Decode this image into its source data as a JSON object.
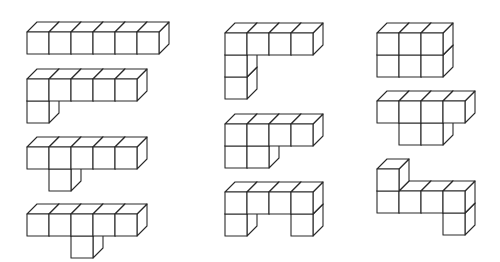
{
  "diagram": {
    "type": "polycube-figures",
    "background": "#ffffff",
    "stroke_color": "#2a2a2a",
    "cube_size": 22,
    "depth_dx": 10,
    "depth_dy": -10,
    "columns": 3,
    "figures": [
      {
        "name": "figure-1",
        "column": 1,
        "origin": [
          27,
          32
        ],
        "cubes": [
          [
            0,
            0
          ],
          [
            1,
            0
          ],
          [
            2,
            0
          ],
          [
            3,
            0
          ],
          [
            4,
            0
          ],
          [
            5,
            0
          ]
        ]
      },
      {
        "name": "figure-2",
        "column": 1,
        "origin": [
          27,
          79
        ],
        "cubes": [
          [
            0,
            0
          ],
          [
            1,
            0
          ],
          [
            2,
            0
          ],
          [
            3,
            0
          ],
          [
            4,
            0
          ],
          [
            0,
            1
          ]
        ]
      },
      {
        "name": "figure-3",
        "column": 1,
        "origin": [
          27,
          147
        ],
        "cubes": [
          [
            0,
            0
          ],
          [
            1,
            0
          ],
          [
            2,
            0
          ],
          [
            3,
            0
          ],
          [
            4,
            0
          ],
          [
            1,
            1
          ]
        ]
      },
      {
        "name": "figure-4",
        "column": 1,
        "origin": [
          27,
          214
        ],
        "cubes": [
          [
            0,
            0
          ],
          [
            1,
            0
          ],
          [
            2,
            0
          ],
          [
            3,
            0
          ],
          [
            4,
            0
          ],
          [
            2,
            1
          ]
        ]
      },
      {
        "name": "figure-5",
        "column": 2,
        "origin": [
          225,
          33
        ],
        "cubes": [
          [
            0,
            0
          ],
          [
            1,
            0
          ],
          [
            2,
            0
          ],
          [
            3,
            0
          ],
          [
            0,
            1
          ],
          [
            0,
            2
          ]
        ]
      },
      {
        "name": "figure-6",
        "column": 2,
        "origin": [
          225,
          124
        ],
        "cubes": [
          [
            0,
            0
          ],
          [
            1,
            0
          ],
          [
            2,
            0
          ],
          [
            3,
            0
          ],
          [
            0,
            1
          ],
          [
            1,
            1
          ]
        ]
      },
      {
        "name": "figure-7",
        "column": 2,
        "origin": [
          225,
          192
        ],
        "cubes": [
          [
            0,
            0
          ],
          [
            1,
            0
          ],
          [
            2,
            0
          ],
          [
            3,
            0
          ],
          [
            0,
            1
          ],
          [
            3,
            1
          ]
        ]
      },
      {
        "name": "figure-8",
        "column": 3,
        "origin": [
          377,
          33
        ],
        "cubes": [
          [
            0,
            0
          ],
          [
            1,
            0
          ],
          [
            2,
            0
          ],
          [
            0,
            1
          ],
          [
            1,
            1
          ],
          [
            2,
            1
          ]
        ]
      },
      {
        "name": "figure-9",
        "column": 3,
        "origin": [
          377,
          101
        ],
        "cubes": [
          [
            0,
            0
          ],
          [
            1,
            0
          ],
          [
            2,
            0
          ],
          [
            3,
            0
          ],
          [
            1,
            1
          ],
          [
            2,
            1
          ]
        ]
      },
      {
        "name": "figure-10",
        "column": 3,
        "origin": [
          377,
          169
        ],
        "cubes": [
          [
            0,
            0
          ],
          [
            0,
            1
          ],
          [
            1,
            1
          ],
          [
            2,
            1
          ],
          [
            3,
            1
          ],
          [
            3,
            2
          ]
        ]
      }
    ]
  }
}
